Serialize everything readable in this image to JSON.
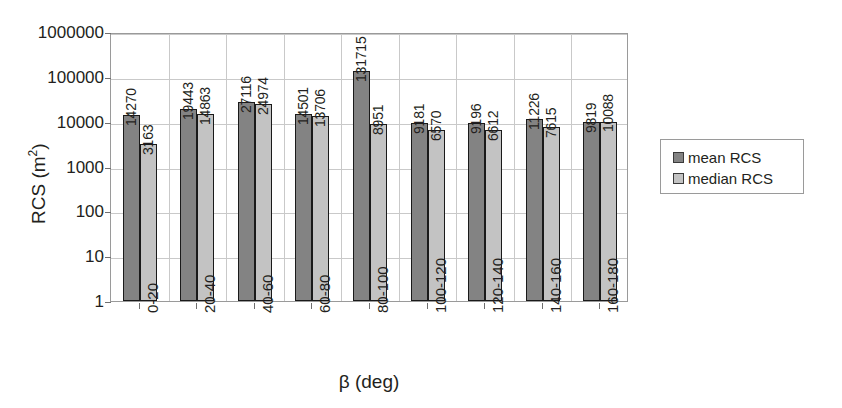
{
  "chart_data": {
    "type": "bar",
    "title": "",
    "xlabel": "β (deg)",
    "ylabel": "RCS (m²)",
    "yscale": "log",
    "ylim": [
      1,
      1000000
    ],
    "ytick_labels": [
      "1000000",
      "100000",
      "10000",
      "1000",
      "100",
      "10",
      "1"
    ],
    "ytick_values": [
      1000000,
      100000,
      10000,
      1000,
      100,
      10,
      1
    ],
    "grid": "horizontal-and-vertical",
    "legend_position": "right",
    "categories": [
      "0-20",
      "20-40",
      "40-60",
      "60-80",
      "80-100",
      "100-120",
      "120-140",
      "140-160",
      "160-180"
    ],
    "series": [
      {
        "name": "mean RCS",
        "color": "#838383",
        "values": [
          14270,
          19443,
          27116,
          14501,
          131715,
          9181,
          9196,
          11226,
          9819
        ]
      },
      {
        "name": "median RCS",
        "color": "#c3c3c3",
        "values": [
          3163,
          14863,
          24974,
          13706,
          8951,
          6570,
          6612,
          7615,
          10088
        ]
      }
    ]
  },
  "axis": {
    "y_title_main": "RCS (m",
    "y_title_sup": "2",
    "y_title_close": ")",
    "x_title": "β (deg)"
  }
}
